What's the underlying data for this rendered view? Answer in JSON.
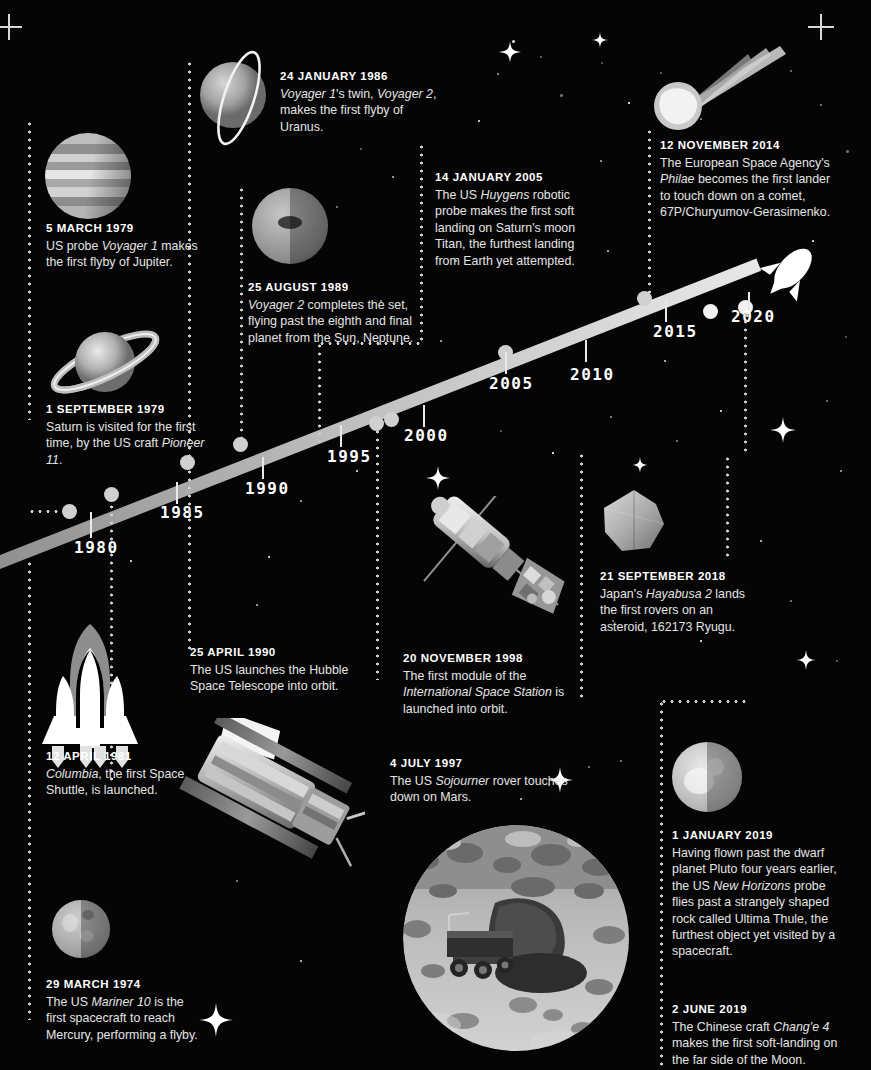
{
  "page": {
    "background_color": "#000000",
    "accent_color": "#e8e8e8"
  },
  "timeline": {
    "axis_label": "Years",
    "years": [
      "1980",
      "1985",
      "1990",
      "1995",
      "2000",
      "2005",
      "2010",
      "2015",
      "2020"
    ],
    "band_start_year": 1974,
    "band_end_year": 2021,
    "rocket_icon": "rocket-icon",
    "comet_icon": "comet-icon"
  },
  "events": [
    {
      "id": "mariner-10",
      "date": "29 MARCH 1974",
      "body_html": "The US <i>Mariner 10</i> is the first spacecraft to reach Mercury, performing a flyby.",
      "body_text": "The US Mariner 10 is the first spacecraft to reach Mercury, performing a flyby.",
      "image": "mercury-planet"
    },
    {
      "id": "voyager-1-jupiter",
      "date": "5 MARCH 1979",
      "body_html": "US probe <i>Voyager 1</i> makes the first flyby of Jupiter.",
      "body_text": "US probe Voyager 1 makes the first flyby of Jupiter.",
      "image": "jupiter-planet"
    },
    {
      "id": "pioneer-11-saturn",
      "date": "1 SEPTEMBER 1979",
      "body_html": "Saturn is visited for the first time, by the US craft <i>Pioneer 11</i>.",
      "body_text": "Saturn is visited for the first time, by the US craft Pioneer 11.",
      "image": "saturn-planet"
    },
    {
      "id": "columbia-shuttle",
      "date": "12 APRIL 1981",
      "body_html": "<i>Columbia</i>, the first Space Shuttle, is launched.",
      "body_text": "Columbia, the first Space Shuttle, is launched.",
      "image": "space-shuttle"
    },
    {
      "id": "voyager-2-uranus",
      "date": "24 JANUARY 1986",
      "body_html": "<i>Voyager 1</i>'s twin, <i>Voyager 2</i>, makes the first flyby of Uranus.",
      "body_text": "Voyager 1's twin, Voyager 2, makes the first flyby of Uranus.",
      "image": "uranus-planet"
    },
    {
      "id": "voyager-2-neptune",
      "date": "25 AUGUST 1989",
      "body_html": "<i>Voyager 2</i> completes the set, flying past the eighth and final planet from the Sun, Neptune.",
      "body_text": "Voyager 2 completes the set, flying past the eighth and final planet from the Sun, Neptune.",
      "image": "neptune-planet"
    },
    {
      "id": "hubble-telescope",
      "date": "25 APRIL 1990",
      "body_html": "The US launches the Hubble Space Telescope into orbit.",
      "body_text": "The US launches the Hubble Space Telescope into orbit.",
      "image": "hubble-photo"
    },
    {
      "id": "sojourner-mars",
      "date": "4 JULY 1997",
      "body_html": "The US <i>Sojourner</i> rover touches down on Mars.",
      "body_text": "The US Sojourner rover touches down on Mars.",
      "image": "mars-rover-photo"
    },
    {
      "id": "iss-first-module",
      "date": "20 NOVEMBER 1998",
      "body_html": "The first module of the <i>International Space Station</i> is launched into orbit.",
      "body_text": "The first module of the International Space Station is launched into orbit.",
      "image": "iss-photo"
    },
    {
      "id": "huygens-titan",
      "date": "14 JANUARY 2005",
      "body_html": "The US <i>Huygens</i> robotic probe makes the first soft landing on Saturn's moon Titan, the furthest landing from Earth yet attempted.",
      "body_text": "The US Huygens robotic probe makes the first soft landing on Saturn's moon Titan, the furthest landing from Earth yet attempted.",
      "image": ""
    },
    {
      "id": "philae-comet",
      "date": "12 NOVEMBER 2014",
      "body_html": "The European Space Agency's <i>Philae</i> becomes the first lander to touch down on a comet, 67P/Churyumov-Gerasimenko.",
      "body_text": "The European Space Agency's Philae becomes the first lander to touch down on a comet, 67P/Churyumov-Gerasimenko.",
      "image": "comet-icon"
    },
    {
      "id": "hayabusa-2-ryugu",
      "date": "21 SEPTEMBER 2018",
      "body_html": "Japan's <i>Hayabusa 2</i> lands the first rovers on an asteroid, 162173 Ryugu.",
      "body_text": "Japan's Hayabusa 2 lands the first rovers on an asteroid, 162173 Ryugu.",
      "image": "asteroid-ryugu"
    },
    {
      "id": "new-horizons-ultima-thule",
      "date": "1 JANUARY 2019",
      "body_html": "Having flown past the dwarf planet Pluto four years earlier, the US <i>New Horizons</i> probe flies past a strangely shaped rock called Ultima Thule, the furthest object yet visited by a spacecraft.",
      "body_text": "Having flown past the dwarf planet Pluto four years earlier, the US New Horizons probe flies past a strangely shaped rock called Ultima Thule, the furthest object yet visited by a spacecraft.",
      "image": "pluto-body"
    },
    {
      "id": "change-4-moon",
      "date": "2 JUNE 2019",
      "body_html": "The Chinese craft <i>Chang'e 4</i> makes the first soft-landing on the far side of the Moon.",
      "body_text": "The Chinese craft Chang'e 4 makes the first soft-landing on the far side of the Moon.",
      "image": ""
    }
  ]
}
